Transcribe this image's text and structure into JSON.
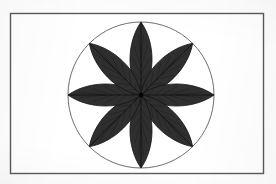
{
  "figure": {
    "caption": "",
    "canvas": {
      "width": 276,
      "height": 184,
      "background": "#fdfdfd"
    },
    "frame": {
      "name": "outer-border",
      "x": 10.5,
      "y": 13.5,
      "width": 253,
      "height": 160,
      "stroke": "#5a5a5a",
      "stroke_width": 1.4,
      "fill": "#ffffff"
    },
    "circle": {
      "name": "construction-circle",
      "cx": 141,
      "cy": 95,
      "r": 73,
      "stroke": "#6e6e6e",
      "stroke_width": 1,
      "fill": "none"
    },
    "rosette": {
      "name": "eight-petal-rosette",
      "center_x": 141,
      "center_y": 95,
      "petal_count": 8,
      "petal_length": 73,
      "petal_half_width": 15,
      "angle_step_degrees": 45,
      "start_angle_degrees": -90,
      "petal_fill": "#2f2f2f",
      "petal_stroke": "#141414",
      "petal_stroke_width": 0.8,
      "vein_stroke": "#0d0d0d",
      "vein_stroke_width": 0.7,
      "petal_angles": [
        -90,
        -45,
        0,
        45,
        90,
        135,
        180,
        225
      ],
      "petal_labels": [
        "petal-north",
        "petal-northeast",
        "petal-east",
        "petal-southeast",
        "petal-south",
        "petal-southwest",
        "petal-west",
        "petal-northwest"
      ]
    },
    "center_dot": {
      "name": "rosette-center",
      "cx": 141,
      "cy": 95,
      "r": 2.2,
      "fill": "#000000"
    }
  }
}
